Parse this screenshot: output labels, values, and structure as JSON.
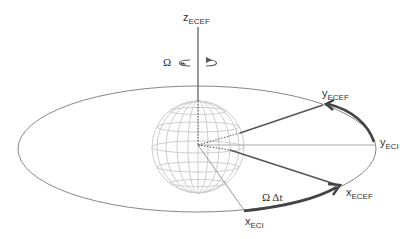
{
  "labels": {
    "z_ecef": {
      "main": "z",
      "sub": "ECEF"
    },
    "y_ecef": {
      "main": "y",
      "sub": "ECEF"
    },
    "y_eci": {
      "main": "y",
      "sub": "ECI"
    },
    "x_ecef": {
      "main": "x",
      "sub": "ECEF"
    },
    "x_eci": {
      "main": "x",
      "sub": "ECI"
    },
    "omega": "Ω",
    "omega_dt": "Ω Δt"
  },
  "colors": {
    "ellipse": "#888888",
    "globe": "#c8c8c8",
    "eci_axis": "#aaaaaa",
    "ecef_axis": "#555555",
    "rotation_arrow": "#444444"
  }
}
